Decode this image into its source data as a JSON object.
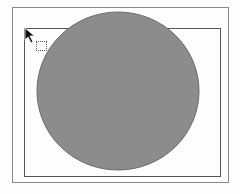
{
  "canvas": {
    "background": "#fdfdfd",
    "outer_frame": {
      "x": 12,
      "y": 7,
      "width": 217,
      "height": 176,
      "stroke": "#8a8a8a"
    },
    "inner_frame": {
      "x": 24,
      "y": 28,
      "width": 197,
      "height": 149,
      "stroke": "#555555"
    },
    "ellipse": {
      "cx": 118,
      "cy": 91,
      "rx": 81,
      "ry": 79,
      "fill": "#8c8c8c",
      "stroke": "#6a6a6a"
    }
  },
  "cursor": {
    "icon": "arrow-pointer-icon",
    "drag_indicator": "dotted-rectangle-icon",
    "x": 24,
    "y": 27
  }
}
